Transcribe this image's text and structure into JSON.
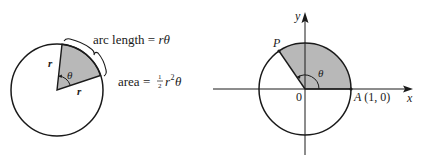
{
  "left_figure": {
    "labels": {
      "arc_length_prefix": "arc length = ",
      "arc_length_var": "rθ",
      "area_prefix": "area = ",
      "area_frac_num": "1",
      "area_frac_den": "2",
      "area_var_r": "r",
      "area_exp": "2",
      "area_var_theta": "θ",
      "radius_top": "r",
      "radius_bottom": "r",
      "angle": "θ"
    }
  },
  "right_figure": {
    "labels": {
      "y_axis": "y",
      "x_axis": "x",
      "origin": "0",
      "point_p": "P",
      "point_a": "A",
      "point_a_coords": "(1, 0)",
      "angle": "θ"
    }
  },
  "colors": {
    "stroke": "#1a1a1a",
    "sector_fill": "#b8b8b8",
    "background": "#ffffff"
  }
}
